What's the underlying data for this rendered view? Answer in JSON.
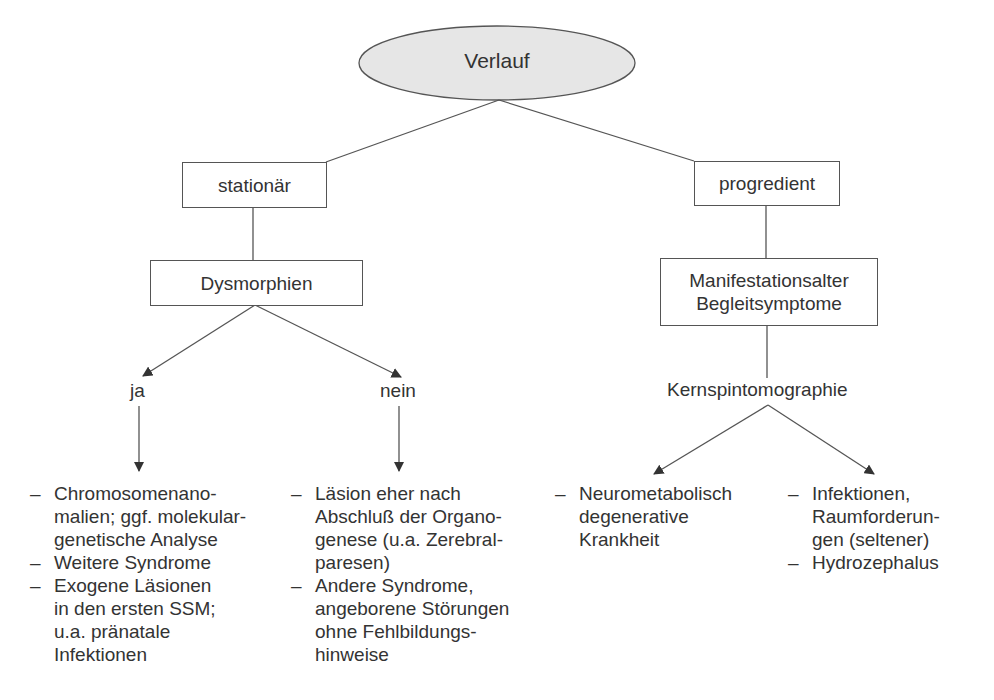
{
  "diagram": {
    "root": {
      "label": "Verlauf",
      "fill": "#e6e6e6"
    },
    "branches": {
      "left": {
        "label": "stationär",
        "child": {
          "label": "Dysmorphien"
        },
        "options": [
          {
            "label": "ja",
            "items": [
              [
                "Chromosomenano-",
                "malien; ggf. molekular-",
                "genetische Analyse"
              ],
              [
                "Weitere Syndrome"
              ],
              [
                "Exogene Läsionen",
                "in den ersten SSM;",
                "u.a. pränatale",
                "Infektionen"
              ]
            ]
          },
          {
            "label": "nein",
            "items": [
              [
                "Läsion eher nach",
                "Abschluß der Organo-",
                "genese (u.a. Zerebral-",
                "paresen)"
              ],
              [
                "Andere Syndrome,",
                "angeborene Störungen",
                "ohne Fehlbildungs-",
                "hinweise"
              ]
            ]
          }
        ]
      },
      "right": {
        "label": "progredient",
        "child": {
          "line1": "Manifestationsalter",
          "line2": "Begleitsymptome"
        },
        "method": "Kernspintomographie",
        "outcomes": [
          {
            "items": [
              [
                "Neurometabolisch",
                "degenerative",
                "Krankheit"
              ]
            ]
          },
          {
            "items": [
              [
                "Infektionen,",
                "Raumforderun-",
                "gen (seltener)"
              ],
              [
                "Hydrozephalus"
              ]
            ]
          }
        ]
      }
    },
    "dash": "–",
    "colors": {
      "line": "#555555",
      "text": "#333333",
      "ellipse_fill": "#e6e6e6"
    }
  }
}
